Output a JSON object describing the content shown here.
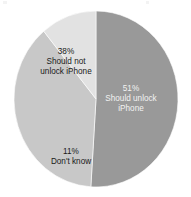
{
  "chart_data": {
    "type": "pie",
    "title": "",
    "subtitle": "",
    "xlabel": "",
    "ylabel": "",
    "legend_position": "none",
    "grid": false,
    "units": "percent",
    "total": 100,
    "start_angle_deg": 0,
    "direction": "clockwise",
    "categories": [
      "Should unlock iPhone",
      "Should not unlock iPhone",
      "Don't know"
    ],
    "values": [
      51,
      38,
      11
    ],
    "slices": [
      {
        "label": "Should unlock iPhone",
        "value": 51,
        "value_text": "51%",
        "label_lines": [
          "51%",
          "Should unlock",
          "iPhone"
        ],
        "color": "#999999",
        "text_color": "#f2f2f2",
        "text_style": "light",
        "label_x": 131,
        "label_y": 99
      },
      {
        "label": "Should not unlock iPhone",
        "value": 38,
        "value_text": "38%",
        "label_lines": [
          "38%",
          "Should not",
          "unlock iPhone"
        ],
        "color": "#c8c8c8",
        "text_color": "#1a1a1a",
        "text_style": "dark",
        "label_x": 66,
        "label_y": 62
      },
      {
        "label": "Don't know",
        "value": 11,
        "value_text": "11%",
        "label_lines": [
          "11%",
          "Don't know"
        ],
        "color": "#e2e2e2",
        "text_color": "#1a1a1a",
        "text_style": "dark",
        "label_x": 71,
        "label_y": 157
      }
    ],
    "geometry": {
      "center_x": 96,
      "center_y": 99,
      "radius_x": 82,
      "radius_y": 88
    },
    "background_color": "#ffffff"
  }
}
